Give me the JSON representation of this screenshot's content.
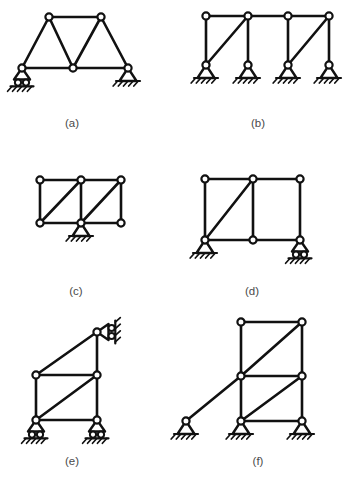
{
  "sheet": {
    "title": "Truss and frame support configurations",
    "background_color": "#ffffff",
    "line_color": "#111111",
    "caption_color": "#4a4a4a"
  },
  "figures": [
    {
      "id": "a",
      "caption": "(a)",
      "caption_pos": [
        72,
        124
      ],
      "description": "Trapezoidal truss with roller support at left and pin support at right",
      "joints": [
        {
          "name": "bottom-left",
          "x": 22,
          "y": 68
        },
        {
          "name": "bottom-mid",
          "x": 73,
          "y": 68
        },
        {
          "name": "bottom-right",
          "x": 128,
          "y": 68
        },
        {
          "name": "top-left",
          "x": 49,
          "y": 17
        },
        {
          "name": "top-right",
          "x": 101,
          "y": 17
        }
      ],
      "members": [
        {
          "from": "bottom-left",
          "to": "bottom-mid"
        },
        {
          "from": "bottom-mid",
          "to": "bottom-right"
        },
        {
          "from": "top-left",
          "to": "top-right"
        },
        {
          "from": "bottom-left",
          "to": "top-left"
        },
        {
          "from": "top-left",
          "to": "bottom-mid"
        },
        {
          "from": "bottom-mid",
          "to": "top-right"
        },
        {
          "from": "top-right",
          "to": "bottom-right"
        }
      ],
      "supports": [
        {
          "type": "roller",
          "at": "bottom-left",
          "orientation": "up"
        },
        {
          "type": "pin",
          "at": "bottom-right",
          "orientation": "up"
        }
      ]
    },
    {
      "id": "b",
      "caption": "(b)",
      "caption_pos": [
        258,
        124
      ],
      "description": "Continuous top chord on four columns with two diagonals, four pin supports",
      "joints": [
        {
          "name": "top-1",
          "x": 206,
          "y": 16
        },
        {
          "name": "top-2",
          "x": 248,
          "y": 16
        },
        {
          "name": "top-3",
          "x": 288,
          "y": 16
        },
        {
          "name": "top-4",
          "x": 329,
          "y": 16
        },
        {
          "name": "base-1",
          "x": 206,
          "y": 65
        },
        {
          "name": "base-2",
          "x": 248,
          "y": 65
        },
        {
          "name": "base-3",
          "x": 288,
          "y": 65
        },
        {
          "name": "base-4",
          "x": 329,
          "y": 65
        }
      ],
      "members": [
        {
          "from": "top-1",
          "to": "top-2"
        },
        {
          "from": "top-2",
          "to": "top-3"
        },
        {
          "from": "top-3",
          "to": "top-4"
        },
        {
          "from": "top-1",
          "to": "base-1"
        },
        {
          "from": "top-2",
          "to": "base-2"
        },
        {
          "from": "top-3",
          "to": "base-3"
        },
        {
          "from": "top-4",
          "to": "base-4"
        },
        {
          "from": "base-1",
          "to": "top-2"
        },
        {
          "from": "base-3",
          "to": "top-4"
        }
      ],
      "supports": [
        {
          "type": "pin",
          "at": "base-1",
          "orientation": "up"
        },
        {
          "type": "pin",
          "at": "base-2",
          "orientation": "up"
        },
        {
          "type": "pin",
          "at": "base-3",
          "orientation": "up"
        },
        {
          "type": "pin",
          "at": "base-4",
          "orientation": "up"
        }
      ]
    },
    {
      "id": "c",
      "caption": "(c)",
      "caption_pos": [
        76,
        292
      ],
      "description": "Two-bay rectangular truss with diagonals, single pin support under bottom middle joint",
      "joints": [
        {
          "name": "top-left",
          "x": 40,
          "y": 180
        },
        {
          "name": "top-mid",
          "x": 81,
          "y": 180
        },
        {
          "name": "top-right",
          "x": 121,
          "y": 180
        },
        {
          "name": "bot-left",
          "x": 40,
          "y": 223
        },
        {
          "name": "bot-mid",
          "x": 81,
          "y": 223
        },
        {
          "name": "bot-right",
          "x": 121,
          "y": 223
        }
      ],
      "members": [
        {
          "from": "top-left",
          "to": "top-mid"
        },
        {
          "from": "top-mid",
          "to": "top-right"
        },
        {
          "from": "bot-left",
          "to": "bot-mid"
        },
        {
          "from": "bot-mid",
          "to": "bot-right"
        },
        {
          "from": "top-left",
          "to": "bot-left"
        },
        {
          "from": "top-mid",
          "to": "bot-mid"
        },
        {
          "from": "top-right",
          "to": "bot-right"
        },
        {
          "from": "bot-left",
          "to": "top-mid"
        },
        {
          "from": "bot-mid",
          "to": "top-right"
        }
      ],
      "supports": [
        {
          "type": "pin",
          "at": "bot-mid",
          "orientation": "up"
        }
      ]
    },
    {
      "id": "d",
      "caption": "(d)",
      "caption_pos": [
        252,
        292
      ],
      "description": "Two-bay frame with one diagonal, pin support at bottom left and roller support at bottom right",
      "joints": [
        {
          "name": "top-left",
          "x": 205,
          "y": 179
        },
        {
          "name": "top-mid",
          "x": 253,
          "y": 179
        },
        {
          "name": "top-right",
          "x": 300,
          "y": 179
        },
        {
          "name": "bot-left",
          "x": 205,
          "y": 240
        },
        {
          "name": "bot-mid",
          "x": 253,
          "y": 240
        },
        {
          "name": "bot-right",
          "x": 300,
          "y": 240
        }
      ],
      "members": [
        {
          "from": "top-left",
          "to": "top-mid"
        },
        {
          "from": "top-mid",
          "to": "top-right"
        },
        {
          "from": "bot-left",
          "to": "bot-mid"
        },
        {
          "from": "bot-mid",
          "to": "bot-right"
        },
        {
          "from": "top-left",
          "to": "bot-left"
        },
        {
          "from": "top-mid",
          "to": "bot-mid"
        },
        {
          "from": "top-right",
          "to": "bot-right"
        },
        {
          "from": "bot-left",
          "to": "top-mid"
        }
      ],
      "supports": [
        {
          "type": "pin",
          "at": "bot-left",
          "orientation": "up"
        },
        {
          "type": "roller",
          "at": "bot-right",
          "orientation": "up"
        }
      ]
    },
    {
      "id": "e",
      "caption": "(e)",
      "caption_pos": [
        72,
        462
      ],
      "description": "Frame with inclined top member, two roller supports at base and a horizontal roller support at the top right against a vertical wall",
      "joints": [
        {
          "name": "apex",
          "x": 97,
          "y": 332
        },
        {
          "name": "mid-left",
          "x": 36,
          "y": 375
        },
        {
          "name": "mid-right",
          "x": 97,
          "y": 375
        },
        {
          "name": "bot-left",
          "x": 36,
          "y": 420
        },
        {
          "name": "bot-right",
          "x": 97,
          "y": 420
        }
      ],
      "members": [
        {
          "from": "mid-left",
          "to": "apex"
        },
        {
          "from": "apex",
          "to": "mid-right"
        },
        {
          "from": "mid-left",
          "to": "mid-right"
        },
        {
          "from": "mid-left",
          "to": "bot-left"
        },
        {
          "from": "mid-right",
          "to": "bot-right"
        },
        {
          "from": "bot-left",
          "to": "bot-right"
        },
        {
          "from": "bot-left",
          "to": "mid-right"
        }
      ],
      "supports": [
        {
          "type": "roller",
          "at": "bot-left",
          "orientation": "up"
        },
        {
          "type": "roller",
          "at": "bot-right",
          "orientation": "up"
        },
        {
          "type": "roller",
          "at": "apex",
          "orientation": "right"
        }
      ]
    },
    {
      "id": "f",
      "caption": "(f)",
      "caption_pos": [
        258,
        462
      ],
      "description": "Two-story braced frame with long inclined strut to a remote pin support at the left; three pin supports",
      "joints": [
        {
          "name": "top-left",
          "x": 241,
          "y": 322
        },
        {
          "name": "top-right",
          "x": 302,
          "y": 322
        },
        {
          "name": "mid-left",
          "x": 241,
          "y": 376
        },
        {
          "name": "mid-right",
          "x": 302,
          "y": 376
        },
        {
          "name": "bot-left",
          "x": 241,
          "y": 421
        },
        {
          "name": "bot-right",
          "x": 302,
          "y": 421
        },
        {
          "name": "far-left",
          "x": 186,
          "y": 421
        }
      ],
      "members": [
        {
          "from": "top-left",
          "to": "top-right"
        },
        {
          "from": "mid-left",
          "to": "mid-right"
        },
        {
          "from": "bot-left",
          "to": "bot-right"
        },
        {
          "from": "top-left",
          "to": "mid-left"
        },
        {
          "from": "mid-left",
          "to": "bot-left"
        },
        {
          "from": "top-right",
          "to": "mid-right"
        },
        {
          "from": "mid-right",
          "to": "bot-right"
        },
        {
          "from": "mid-left",
          "to": "top-right"
        },
        {
          "from": "bot-left",
          "to": "mid-right"
        },
        {
          "from": "far-left",
          "to": "mid-left"
        }
      ],
      "supports": [
        {
          "type": "pin",
          "at": "far-left",
          "orientation": "up"
        },
        {
          "type": "pin",
          "at": "bot-left",
          "orientation": "up"
        },
        {
          "type": "pin",
          "at": "bot-right",
          "orientation": "up"
        }
      ]
    }
  ]
}
